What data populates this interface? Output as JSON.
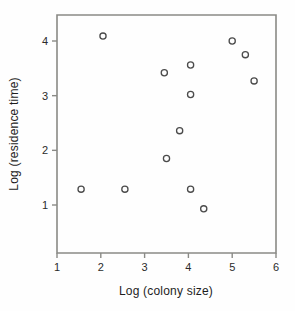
{
  "chart_data": {
    "type": "scatter",
    "title": "",
    "xlabel": "Log (colony size)",
    "ylabel": "Log (residence time)",
    "xlim": [
      1,
      6
    ],
    "ylim": [
      0.5,
      4.45
    ],
    "xticks": [
      1,
      2,
      3,
      4,
      5,
      6
    ],
    "yticks": [
      1,
      2,
      3,
      4
    ],
    "xticklabels": [
      "1",
      "2",
      "3",
      "4",
      "5",
      "6"
    ],
    "yticklabels": [
      "1",
      "2",
      "3",
      "4"
    ],
    "grid": false,
    "legend": null,
    "marker": "open-circle",
    "marker_color": "#4b4b4b",
    "frame_color": "#8a8a86",
    "background": "#fefefe",
    "points": [
      {
        "x": 2.05,
        "y": 4.09
      },
      {
        "x": 1.55,
        "y": 1.29
      },
      {
        "x": 2.55,
        "y": 1.29
      },
      {
        "x": 3.45,
        "y": 3.42
      },
      {
        "x": 3.5,
        "y": 1.85
      },
      {
        "x": 3.8,
        "y": 2.36
      },
      {
        "x": 4.05,
        "y": 3.56
      },
      {
        "x": 4.05,
        "y": 3.02
      },
      {
        "x": 4.05,
        "y": 1.29
      },
      {
        "x": 4.35,
        "y": 0.93
      },
      {
        "x": 5.0,
        "y": 4.0
      },
      {
        "x": 5.3,
        "y": 3.75
      },
      {
        "x": 5.5,
        "y": 3.27
      }
    ]
  }
}
